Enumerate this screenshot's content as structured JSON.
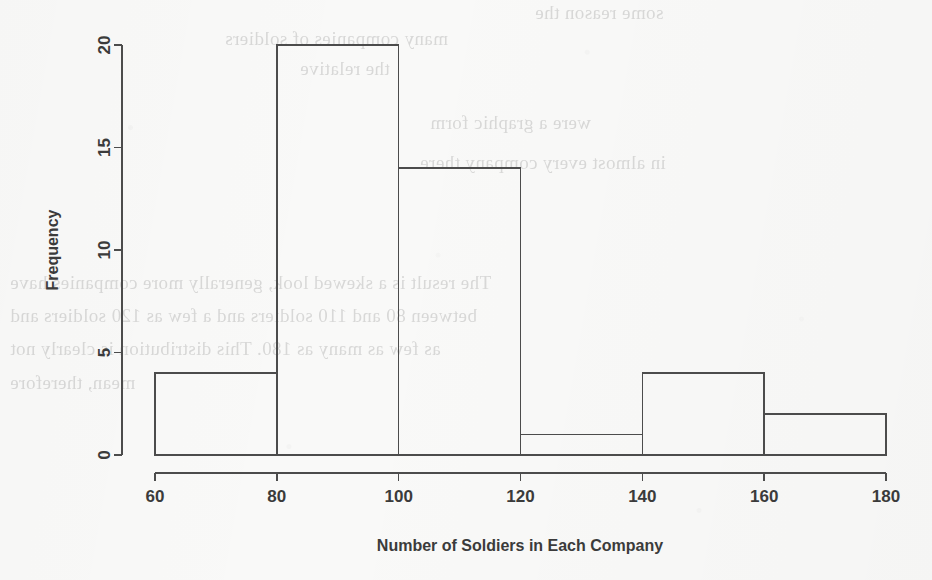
{
  "chart_data": {
    "type": "bar",
    "chart_subtype": "histogram",
    "title": "",
    "xlabel": "Number of Soldiers in Each Company",
    "ylabel": "Frequency",
    "xlim": [
      60,
      180
    ],
    "ylim": [
      0,
      20
    ],
    "grid": false,
    "legend": null,
    "bin_width": 20,
    "bin_edges": [
      60,
      80,
      100,
      120,
      140,
      160,
      180
    ],
    "categories": [
      "60-80",
      "80-100",
      "100-120",
      "120-140",
      "140-160",
      "160-180"
    ],
    "values": [
      4,
      20,
      14,
      1,
      4,
      2
    ],
    "bins": [
      {
        "range": "60-80",
        "start": 60,
        "end": 80,
        "frequency": 4
      },
      {
        "range": "80-100",
        "start": 80,
        "end": 100,
        "frequency": 20
      },
      {
        "range": "100-120",
        "start": 100,
        "end": 120,
        "frequency": 14
      },
      {
        "range": "120-140",
        "start": 120,
        "end": 140,
        "frequency": 1
      },
      {
        "range": "140-160",
        "start": 140,
        "end": 160,
        "frequency": 4
      },
      {
        "range": "160-180",
        "start": 160,
        "end": 180,
        "frequency": 2
      }
    ],
    "xticks": [
      60,
      80,
      100,
      120,
      140,
      160,
      180
    ],
    "xtick_labels": [
      "60",
      "80",
      "100",
      "120",
      "140",
      "160",
      "180"
    ],
    "yticks": [
      0,
      5,
      10,
      15,
      20
    ],
    "ytick_labels": [
      "0",
      "5",
      "10",
      "15",
      "20"
    ],
    "total_count": 45,
    "colors": {
      "background": "#f9f9f8",
      "line": "#4c4c4c",
      "text": "#3b3b3b"
    }
  },
  "axes": {
    "y_title": "Frequency",
    "x_title": "Number of Soldiers in Each Company",
    "ytick_labels": [
      "0",
      "5",
      "10",
      "15",
      "20"
    ],
    "xtick_labels": [
      "60",
      "80",
      "100",
      "120",
      "140",
      "160",
      "180"
    ]
  },
  "scan_artifacts": {
    "description": "faint mirrored show-through text from the reverse side of the scanned page",
    "bleed_lines": [
      "some reason the",
      "many companies of soldiers",
      "the relative",
      "were a graphic form",
      "in almost every company there",
      "The result is a skewed look, generally more companies have",
      "between 80 and 110 soldiers and a few as 120 soldiers and",
      "as few as many as 180. This distribution is clearly not",
      "mean, therefore"
    ]
  }
}
